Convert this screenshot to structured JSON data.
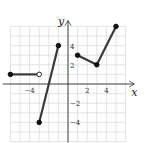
{
  "chart_data": {
    "type": "line",
    "title": "",
    "xlabel": "x",
    "ylabel": "y",
    "xlim": [
      -6,
      6
    ],
    "ylim": [
      -6,
      6
    ],
    "grid": true,
    "x_ticks": [
      {
        "value": -4,
        "label": "−4"
      },
      {
        "value": 2,
        "label": "2"
      },
      {
        "value": 4,
        "label": "4"
      }
    ],
    "y_ticks": [
      {
        "value": 4,
        "label": "4"
      },
      {
        "value": 2,
        "label": "2"
      },
      {
        "value": -2,
        "label": "−2"
      },
      {
        "value": -4,
        "label": "−4"
      }
    ],
    "series": [
      {
        "name": "segment-1",
        "points": [
          [
            -6,
            1
          ],
          [
            -3,
            1
          ]
        ],
        "endpoints": [
          "closed",
          "open"
        ]
      },
      {
        "name": "segment-2",
        "points": [
          [
            -3,
            -4
          ],
          [
            -1,
            4
          ]
        ],
        "endpoints": [
          "closed",
          "closed"
        ]
      },
      {
        "name": "segment-3",
        "points": [
          [
            1,
            3
          ],
          [
            3,
            2
          ],
          [
            5,
            6
          ]
        ],
        "endpoints": [
          "closed",
          "closed",
          "closed"
        ]
      }
    ],
    "colors": {
      "line": "#3a3a3a",
      "grid": "#d8d8d8",
      "axis": "#333333"
    }
  }
}
